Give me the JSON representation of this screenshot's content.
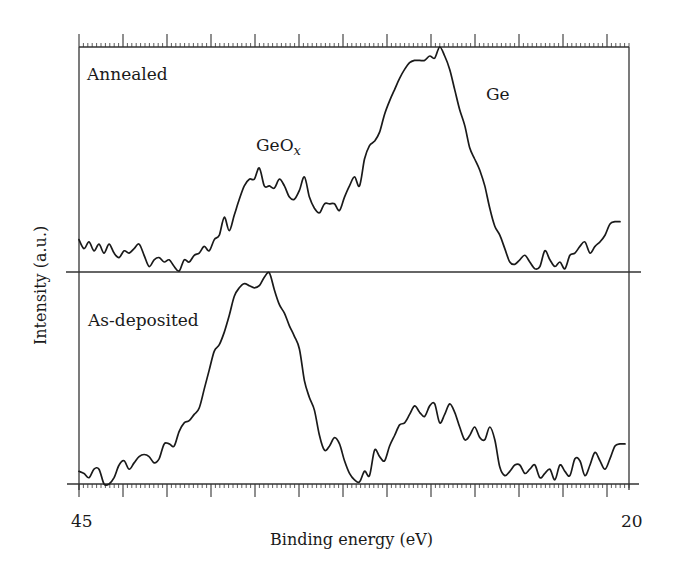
{
  "chart_data": {
    "type": "line",
    "title": "",
    "xlabel": "Binding energy (eV)",
    "ylabel": "Intensity (a.u.)",
    "xlim": [
      45,
      20
    ],
    "x_reversed": true,
    "x_tick_labels": [
      "45",
      "20"
    ],
    "major_tick_interval_eV": 2,
    "minor_ticks_per_major": 10,
    "grid": false,
    "legend": null,
    "annotations": [
      {
        "text": "Annealed",
        "panel": "top"
      },
      {
        "text": "As-deposited",
        "panel": "bottom"
      },
      {
        "text": "GeO",
        "subscript": "x",
        "panel": "top",
        "near_eV": 35.5
      },
      {
        "text": "Ge",
        "panel": "top",
        "near_eV": 29.3
      }
    ],
    "series": [
      {
        "name": "Annealed",
        "panel": "top",
        "energy_start": 45.0,
        "energy_step": -0.2277,
        "intensity": [
          0.14,
          0.1,
          0.13,
          0.09,
          0.12,
          0.08,
          0.12,
          0.08,
          0.06,
          0.09,
          0.08,
          0.1,
          0.12,
          0.07,
          0.02,
          0.05,
          0.06,
          0.04,
          0.05,
          0.02,
          0.0,
          0.05,
          0.04,
          0.07,
          0.08,
          0.11,
          0.09,
          0.14,
          0.16,
          0.24,
          0.18,
          0.25,
          0.32,
          0.38,
          0.41,
          0.41,
          0.46,
          0.38,
          0.38,
          0.37,
          0.41,
          0.38,
          0.33,
          0.32,
          0.36,
          0.42,
          0.33,
          0.28,
          0.26,
          0.3,
          0.3,
          0.3,
          0.27,
          0.33,
          0.38,
          0.42,
          0.38,
          0.5,
          0.56,
          0.58,
          0.62,
          0.7,
          0.76,
          0.81,
          0.86,
          0.9,
          0.93,
          0.94,
          0.94,
          0.94,
          0.96,
          0.95,
          1.0,
          0.96,
          0.9,
          0.81,
          0.72,
          0.65,
          0.55,
          0.5,
          0.45,
          0.38,
          0.28,
          0.2,
          0.16,
          0.1,
          0.04,
          0.03,
          0.05,
          0.07,
          0.04,
          0.01,
          0.02,
          0.09,
          0.05,
          0.02,
          0.04,
          0.01,
          0.07,
          0.08,
          0.11,
          0.13,
          0.08,
          0.11,
          0.13,
          0.16,
          0.21,
          0.22,
          0.22
        ]
      },
      {
        "name": "As-deposited",
        "panel": "bottom",
        "energy_start": 45.0,
        "energy_step": -0.2277,
        "intensity": [
          0.06,
          0.05,
          0.03,
          0.07,
          0.07,
          0.0,
          0.0,
          0.03,
          0.09,
          0.11,
          0.07,
          0.1,
          0.13,
          0.14,
          0.13,
          0.1,
          0.12,
          0.19,
          0.19,
          0.18,
          0.25,
          0.29,
          0.3,
          0.33,
          0.36,
          0.45,
          0.54,
          0.63,
          0.66,
          0.72,
          0.8,
          0.89,
          0.93,
          0.95,
          0.94,
          0.93,
          0.94,
          0.98,
          1.0,
          0.92,
          0.85,
          0.81,
          0.75,
          0.7,
          0.64,
          0.49,
          0.41,
          0.35,
          0.23,
          0.16,
          0.18,
          0.22,
          0.19,
          0.11,
          0.05,
          0.02,
          0.01,
          0.06,
          0.04,
          0.16,
          0.13,
          0.11,
          0.18,
          0.23,
          0.28,
          0.29,
          0.33,
          0.37,
          0.34,
          0.32,
          0.37,
          0.38,
          0.29,
          0.33,
          0.38,
          0.34,
          0.27,
          0.21,
          0.23,
          0.27,
          0.22,
          0.21,
          0.27,
          0.21,
          0.08,
          0.04,
          0.06,
          0.09,
          0.09,
          0.05,
          0.07,
          0.09,
          0.03,
          0.05,
          0.07,
          0.02,
          0.09,
          0.06,
          0.04,
          0.12,
          0.11,
          0.04,
          0.09,
          0.15,
          0.11,
          0.07,
          0.12,
          0.18,
          0.19,
          0.19
        ]
      }
    ]
  },
  "labels": {
    "panel_top": "Annealed",
    "panel_bottom": "As-deposited",
    "peak_geox_main": "GeO",
    "peak_geox_sub": "x",
    "peak_ge": "Ge",
    "x_tick_left": "45",
    "x_tick_right": "20",
    "x_axis_title": "Binding energy (eV)",
    "y_axis_title": "Intensity (a.u.)"
  },
  "colors": {
    "line": "#1a1a1a",
    "axis": "#333333",
    "background": "#ffffff"
  }
}
